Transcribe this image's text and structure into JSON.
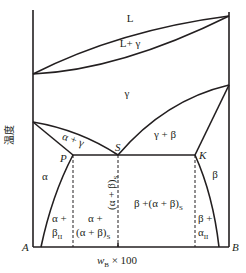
{
  "diagram": {
    "type": "binary-phase-diagram-eutectoid",
    "y_axis_label": "温度",
    "x_axis_label_main": "w",
    "x_axis_label_sub": "B",
    "x_axis_label_suffix": " × 100",
    "components": {
      "left": "A",
      "right": "B"
    },
    "points": {
      "P": "P",
      "S": "S",
      "K": "K"
    },
    "phase_regions": {
      "liquid": "L",
      "liquid_gamma": "L+ γ",
      "gamma": "γ",
      "alpha_gamma": "α + γ",
      "gamma_beta": "γ + β",
      "alpha": "α",
      "beta": "β",
      "eutectoid": "(α + β)",
      "eutectoid_sub": "S",
      "alpha_plus_line1": "α +",
      "alpha_plus_line2": "β",
      "alpha_plus_sub": "II",
      "alpha_eut_line1": "α +",
      "alpha_eut_line2": "(α + β)",
      "alpha_eut_sub": "S",
      "beta_eut": "β +(α + β)",
      "beta_eut_sub": "S",
      "beta_plus_line1": "β +",
      "beta_plus_line2": "α",
      "beta_plus_sub": "II"
    }
  }
}
